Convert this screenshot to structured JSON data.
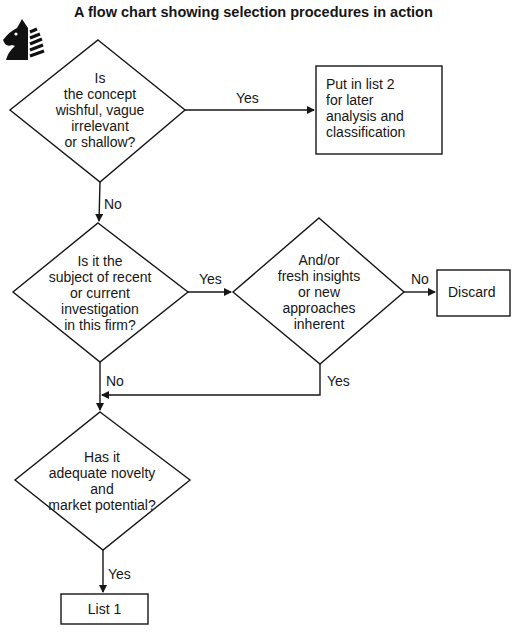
{
  "title": "A flow chart showing selection procedures in action",
  "logo": {
    "icon": "knight-chess-icon"
  },
  "nodes": {
    "q1": {
      "type": "decision",
      "text": "Is\nthe concept\nwishful, vague\nirrelevant\nor shallow?"
    },
    "list2": {
      "type": "process",
      "text": "Put in list 2\nfor later\nanalysis and\nclassification"
    },
    "q2": {
      "type": "decision",
      "text": "Is it the\nsubject of recent\nor current\ninvestigation\nin this firm?"
    },
    "q3": {
      "type": "decision",
      "text": "And/or\nfresh insights\nor new\napproaches\ninherent"
    },
    "discard": {
      "type": "process",
      "text": "Discard"
    },
    "q4": {
      "type": "decision",
      "text": "Has it\nadequate novelty\nand\nmarket potential?"
    },
    "list1": {
      "type": "process",
      "text": "List 1"
    }
  },
  "edges": {
    "q1_list2": {
      "from": "q1",
      "to": "list2",
      "label": "Yes"
    },
    "q1_q2": {
      "from": "q1",
      "to": "q2",
      "label": "No"
    },
    "q2_q3": {
      "from": "q2",
      "to": "q3",
      "label": "Yes"
    },
    "q3_discard": {
      "from": "q3",
      "to": "discard",
      "label": "No"
    },
    "q2_q4": {
      "from": "q2",
      "to": "q4",
      "label": "No"
    },
    "q3_q4": {
      "from": "q3",
      "to": "q4",
      "label": "Yes"
    },
    "q4_list1": {
      "from": "q4",
      "to": "list1",
      "label": "Yes"
    }
  },
  "caption_partial": "The flow ... (text cut off at bottom edge)",
  "colors": {
    "ink": "#161616",
    "background": "#ffffff"
  }
}
